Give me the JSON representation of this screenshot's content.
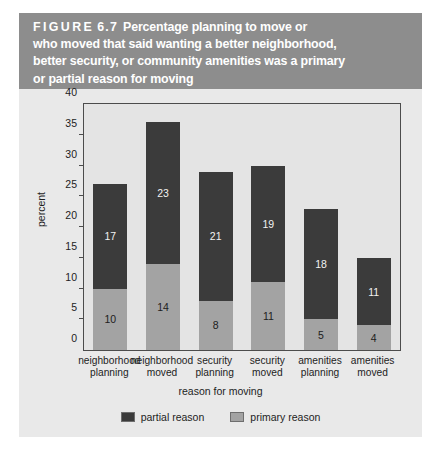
{
  "figure": {
    "caption_lines": [
      "Percentage planning to move or",
      "who moved that said wanting a better neighborhood,",
      "better security, or community amenities was a primary",
      "or partial reason for moving"
    ],
    "caption_tag": "FIGURE",
    "caption_number": "6.7",
    "banner_color": "#8d8d8d",
    "panel_color": "#e9e9e9"
  },
  "chart_data": {
    "type": "bar",
    "stacked": true,
    "title": "Percentage planning to move or who moved that said wanting a better neighborhood, better security, or community amenities was a primary or partial reason for moving",
    "xlabel": "reason for moving",
    "ylabel": "percent",
    "ylim": [
      0,
      40
    ],
    "yticks": [
      0,
      5,
      10,
      15,
      20,
      25,
      30,
      35,
      40
    ],
    "ytick_labels": [
      "0",
      "5",
      "10",
      "15",
      "20",
      "25",
      "30",
      "35",
      "40"
    ],
    "grid": false,
    "legend_position": "bottom",
    "categories": [
      "neighborhood planning",
      "neighborhood moved",
      "security planning",
      "security moved",
      "amenities planning",
      "amenities moved"
    ],
    "category_lines": [
      [
        "neighborhood",
        "planning"
      ],
      [
        "neighborhood",
        "moved"
      ],
      [
        "security",
        "planning"
      ],
      [
        "security",
        "moved"
      ],
      [
        "amenities",
        "planning"
      ],
      [
        "amenities",
        "moved"
      ]
    ],
    "series": [
      {
        "name": "primary reason",
        "color": "#a3a3a3",
        "values": [
          10,
          14,
          8,
          11,
          5,
          4
        ]
      },
      {
        "name": "partial reason",
        "color": "#3b3b3b",
        "values": [
          17,
          23,
          21,
          19,
          18,
          11
        ]
      }
    ],
    "totals": [
      27,
      37,
      29,
      30,
      23,
      15
    ],
    "legend": [
      {
        "label": "partial reason",
        "color": "#3b3b3b"
      },
      {
        "label": "primary reason",
        "color": "#a3a3a3"
      }
    ]
  }
}
